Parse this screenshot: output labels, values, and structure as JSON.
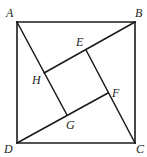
{
  "diagram": {
    "type": "geometry",
    "colors": {
      "stroke": "#1a1a1a",
      "background": "#ffffff",
      "label": "#222222"
    },
    "points": {
      "A": {
        "x": 17,
        "y": 22,
        "label": "A",
        "label_x": 6,
        "label_y": 17
      },
      "B": {
        "x": 135,
        "y": 22,
        "label": "B",
        "label_x": 135,
        "label_y": 17
      },
      "C": {
        "x": 135,
        "y": 143,
        "label": "C",
        "label_x": 136,
        "label_y": 153
      },
      "D": {
        "x": 17,
        "y": 143,
        "label": "D",
        "label_x": 4,
        "label_y": 153
      },
      "E": {
        "x": 86,
        "y": 50,
        "label": "E",
        "label_x": 76,
        "label_y": 46
      },
      "F": {
        "x": 108,
        "y": 93,
        "label": "F",
        "label_x": 112,
        "label_y": 97
      },
      "G": {
        "x": 67,
        "y": 115,
        "label": "G",
        "label_x": 66,
        "label_y": 129
      },
      "H": {
        "x": 44,
        "y": 73,
        "label": "H",
        "label_x": 32,
        "label_y": 84
      }
    },
    "segments": [
      {
        "from": "A",
        "to": "B",
        "name": "side-ab"
      },
      {
        "from": "B",
        "to": "C",
        "name": "side-bc"
      },
      {
        "from": "C",
        "to": "D",
        "name": "side-cd"
      },
      {
        "from": "D",
        "to": "A",
        "name": "side-da"
      },
      {
        "from": "A",
        "to": "G",
        "name": "segment-ag"
      },
      {
        "from": "B",
        "to": "H",
        "name": "segment-bh"
      },
      {
        "from": "C",
        "to": "E",
        "name": "segment-ce"
      },
      {
        "from": "D",
        "to": "F",
        "name": "segment-df"
      }
    ],
    "labels": {
      "A": "A",
      "B": "B",
      "C": "C",
      "D": "D",
      "E": "E",
      "F": "F",
      "G": "G",
      "H": "H"
    }
  }
}
